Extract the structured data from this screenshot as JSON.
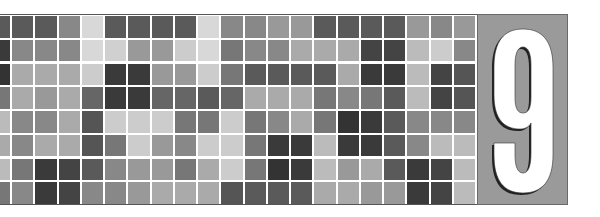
{
  "chapter": {
    "number": "9",
    "panel_color": "#9a9a9a",
    "numeral_color": "#ffffff",
    "numeral_outline": "#222222"
  },
  "grid": {
    "rows": 8,
    "columns": 20,
    "has_partial_left_column": true,
    "line_color": "#ffffff",
    "cells": [
      [
        "#5a5a5a",
        "#5a5a5a",
        "#5a5a5a",
        "#888888",
        "#d8d8d8",
        "#5a5a5a",
        "#5a5a5a",
        "#5a5a5a",
        "#5a5a5a",
        "#d8d8d8",
        "#888888",
        "#888888",
        "#999999",
        "#999999",
        "#5a5a5a",
        "#5a5a5a",
        "#5a5a5a",
        "#5a5a5a",
        "#999999",
        "#888888",
        "#999999"
      ],
      [
        "#3a3a3a",
        "#888888",
        "#888888",
        "#888888",
        "#d8d8d8",
        "#d0d0d0",
        "#999999",
        "#999999",
        "#cccccc",
        "#d8d8d8",
        "#777777",
        "#888888",
        "#888888",
        "#aaaaaa",
        "#aaaaaa",
        "#aaaaaa",
        "#444444",
        "#444444",
        "#bbbbbb",
        "#cccccc",
        "#888888"
      ],
      [
        "#333333",
        "#aaaaaa",
        "#aaaaaa",
        "#aaaaaa",
        "#cccccc",
        "#3a3a3a",
        "#3a3a3a",
        "#999999",
        "#999999",
        "#cccccc",
        "#777777",
        "#5a5a5a",
        "#5a5a5a",
        "#5a5a5a",
        "#5a5a5a",
        "#aaaaaa",
        "#3a3a3a",
        "#3a3a3a",
        "#bbbbbb",
        "#444444",
        "#555555"
      ],
      [
        "#777777",
        "#aaaaaa",
        "#999999",
        "#aaaaaa",
        "#666666",
        "#3a3a3a",
        "#3a3a3a",
        "#666666",
        "#666666",
        "#5a5a5a",
        "#666666",
        "#aaaaaa",
        "#aaaaaa",
        "#aaaaaa",
        "#777777",
        "#888888",
        "#777777",
        "#5a5a5a",
        "#bbbbbb",
        "#444444",
        "#555555"
      ],
      [
        "#bbbbbb",
        "#888888",
        "#888888",
        "#aaaaaa",
        "#555555",
        "#cccccc",
        "#cccccc",
        "#cccccc",
        "#777777",
        "#777777",
        "#cccccc",
        "#777777",
        "#888888",
        "#aaaaaa",
        "#777777",
        "#333333",
        "#3a3a3a",
        "#5a5a5a",
        "#888888",
        "#888888",
        "#888888"
      ],
      [
        "#aaaaaa",
        "#888888",
        "#aaaaaa",
        "#aaaaaa",
        "#555555",
        "#777777",
        "#cccccc",
        "#999999",
        "#888888",
        "#cccccc",
        "#cccccc",
        "#777777",
        "#3a3a3a",
        "#3a3a3a",
        "#bbbbbb",
        "#3a3a3a",
        "#3a3a3a",
        "#5a5a5a",
        "#888888",
        "#bbbbbb",
        "#bbbbbb"
      ],
      [
        "#bbbbbb",
        "#777777",
        "#3a3a3a",
        "#444444",
        "#5a5a5a",
        "#888888",
        "#999999",
        "#999999",
        "#777777",
        "#aaaaaa",
        "#cccccc",
        "#777777",
        "#333333",
        "#3a3a3a",
        "#bbbbbb",
        "#999999",
        "#aaaaaa",
        "#5a5a5a",
        "#3a3a3a",
        "#444444",
        "#bbbbbb"
      ],
      [
        "#777777",
        "#888888",
        "#3a3a3a",
        "#444444",
        "#888888",
        "#888888",
        "#999999",
        "#aaaaaa",
        "#aaaaaa",
        "#aaaaaa",
        "#555555",
        "#5a5a5a",
        "#5a5a5a",
        "#5a5a5a",
        "#aaaaaa",
        "#aaaaaa",
        "#999999",
        "#999999",
        "#3a3a3a",
        "#444444",
        "#bbbbbb"
      ]
    ]
  }
}
